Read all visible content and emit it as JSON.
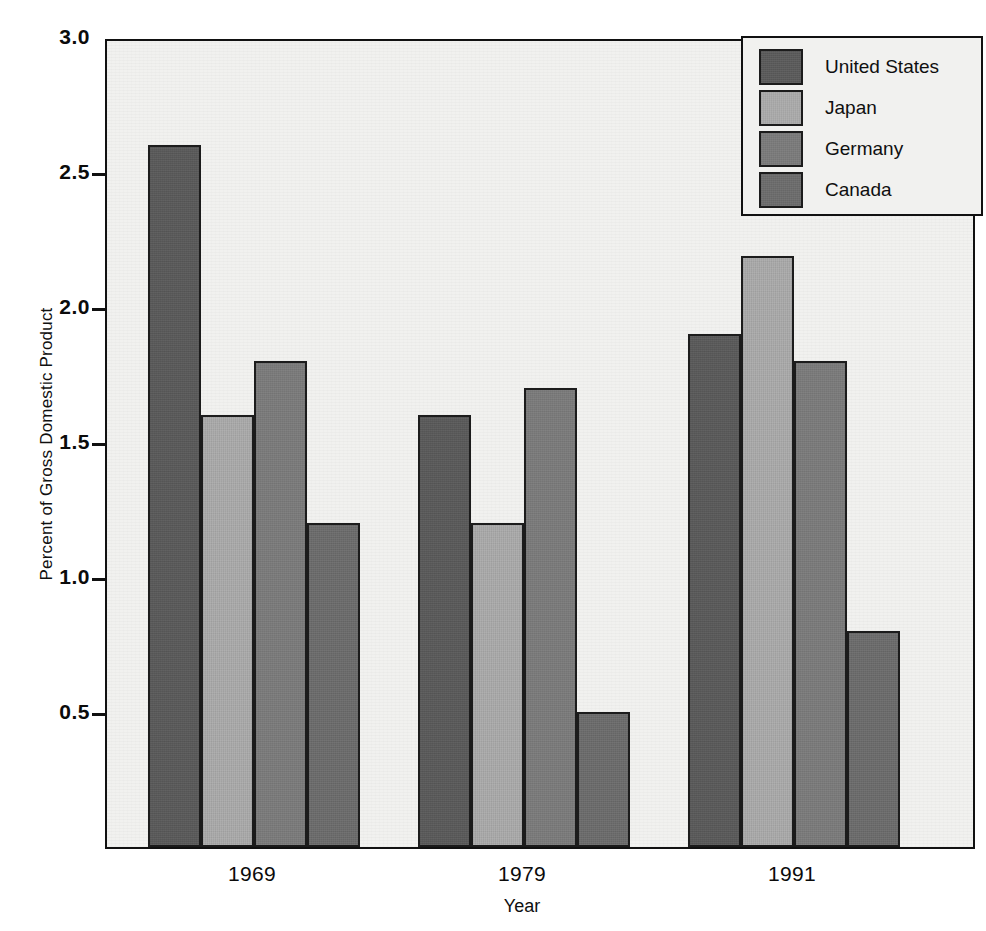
{
  "chart_data": {
    "type": "bar",
    "title": "",
    "subtitle": "",
    "xlabel": "Year",
    "ylabel": "Percent of Gross Domestic Product",
    "categories": [
      "1969",
      "1979",
      "1991"
    ],
    "series": [
      {
        "name": "United States",
        "color": "#5a5a5a",
        "values": [
          2.6,
          1.6,
          1.9
        ]
      },
      {
        "name": "Japan",
        "color": "#ababab",
        "values": [
          1.6,
          1.2,
          2.19
        ]
      },
      {
        "name": "Germany",
        "color": "#7b7b7b",
        "values": [
          1.8,
          1.7,
          1.8
        ]
      },
      {
        "name": "Canada",
        "color": "#6c6c6c",
        "values": [
          1.2,
          0.5,
          0.8
        ]
      }
    ],
    "ylim": [
      0,
      3.0
    ],
    "yticks": [
      0.5,
      1.0,
      1.5,
      2.0,
      2.5,
      3.0
    ],
    "ytick_labels": [
      "0.5",
      "1.0",
      "1.5",
      "2.0",
      "2.5",
      "3.0"
    ],
    "grid": false,
    "legend_position": "top-right",
    "legend_entries": [
      "United States",
      "Japan",
      "Germany",
      "Canada"
    ],
    "annotations": [],
    "plot_background": "#f1f1ef",
    "axis_color": "#111111",
    "bar_edge_color": "#1c1c1c"
  }
}
